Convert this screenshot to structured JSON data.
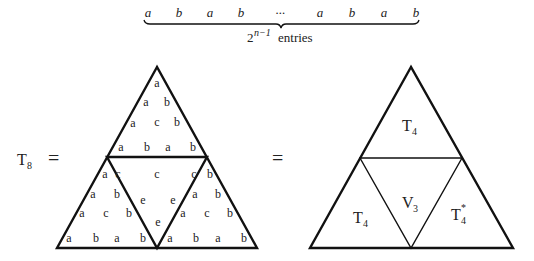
{
  "header": {
    "sequence": [
      "a",
      "b",
      "a",
      "b",
      "···",
      "a",
      "b",
      "a",
      "b"
    ],
    "brace_label_base": "2",
    "brace_label_exp": "n−1",
    "brace_label_text": "entries"
  },
  "equation": {
    "lhs_base": "T",
    "lhs_sub": "8",
    "equals_1": "=",
    "equals_2": "="
  },
  "left_triangle": {
    "top": {
      "rows": [
        [
          "a"
        ],
        [
          "a",
          "b"
        ],
        [
          "a",
          "c",
          "b"
        ],
        [
          "a",
          "b",
          "a",
          "b"
        ]
      ]
    },
    "bottom_left": {
      "rows": [
        [
          "a",
          "c"
        ],
        [
          "a",
          "b"
        ],
        [
          "a",
          "c",
          "b"
        ],
        [
          "a",
          "b",
          "a",
          "b"
        ]
      ]
    },
    "middle": {
      "top_row": [
        "c",
        "c",
        "c"
      ],
      "second_row": [
        "e",
        "e"
      ],
      "bottom": [
        "e"
      ]
    },
    "bottom_right": {
      "rows": [
        [
          "c",
          "b"
        ],
        [
          "a",
          "b"
        ],
        [
          "a",
          "c",
          "b"
        ],
        [
          "a",
          "b",
          "a",
          "b"
        ]
      ]
    }
  },
  "right_triangle": {
    "top": {
      "base": "T",
      "sub": "4",
      "sup": ""
    },
    "middle": {
      "base": "V",
      "sub": "3",
      "sup": ""
    },
    "bottom_left": {
      "base": "T",
      "sub": "4",
      "sup": ""
    },
    "bottom_right": {
      "base": "T",
      "sub": "4",
      "sup": "*"
    }
  }
}
